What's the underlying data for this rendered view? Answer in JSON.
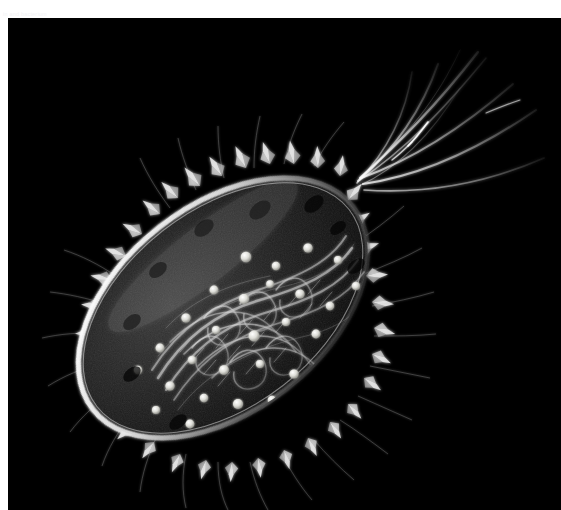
{
  "page": {
    "background_color": "#ffffff",
    "width": 561,
    "height": 510
  },
  "caption": {
    "text": "in and bacterium",
    "color": "#f2f2f4"
  },
  "figure": {
    "title": "Bacterium",
    "style": "scanning-electron-micrograph illustration",
    "background_color": "#000000",
    "cell_color": "#d8d8d8",
    "ribosome_color": "#e8e8e4",
    "panel": {
      "x": 8,
      "y": 18,
      "width": 553,
      "height": 492
    },
    "parts": [
      {
        "name": "cell-body",
        "label": "capsule / cell envelope"
      },
      {
        "name": "flagella",
        "label": "flagella",
        "count": 6
      },
      {
        "name": "pili",
        "label": "pili / fimbriae"
      },
      {
        "name": "nucleoid",
        "label": "nucleoid DNA strands"
      },
      {
        "name": "ribosomes",
        "label": "ribosomes",
        "count": 34
      }
    ]
  }
}
